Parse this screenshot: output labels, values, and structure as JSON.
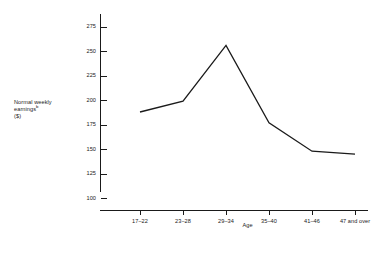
{
  "chart_data": {
    "type": "line",
    "title": "",
    "subtitle": "",
    "xlabel": "Age",
    "ylabel_lines": [
      "Normal weekly",
      "earnings",
      "($)"
    ],
    "ylabel_superscript": "b",
    "ylabel_plain": "Normal weekly earningsᵇ ($)",
    "categories": [
      "17–22",
      "23–28",
      "29–34",
      "35–40",
      "41–46",
      "47 and over"
    ],
    "values": [
      188,
      199,
      256,
      177,
      148,
      145
    ],
    "series": [
      {
        "name": "Normal weekly earnings",
        "values": [
          188,
          199,
          256,
          177,
          148,
          145
        ]
      }
    ],
    "ytick_labels": [
      "100",
      "125",
      "150",
      "175",
      "200",
      "225",
      "250",
      "275"
    ],
    "ytick_values": [
      100,
      125,
      150,
      175,
      200,
      225,
      250,
      275
    ],
    "ylim": [
      88,
      288
    ],
    "grid": false,
    "legend": "none",
    "line_color": "#1a1a1a",
    "axis_color": "#1a1a1a",
    "background_color": "#ffffff"
  }
}
